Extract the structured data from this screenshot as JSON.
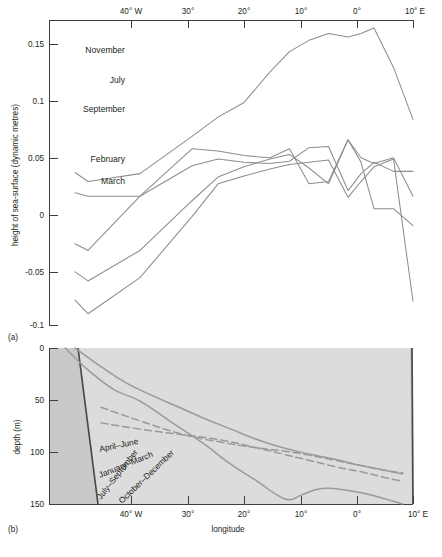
{
  "figure": {
    "panel_a_label": "(a)",
    "panel_b_label": "(b)"
  },
  "panel_a": {
    "y_axis_title": "height of sea-surface  (dynamic metres)",
    "y_ticks": [
      "0.15",
      "0.1",
      "0.05",
      "0",
      "-0.05",
      "-0.1"
    ],
    "x_ticks": [
      "40° W",
      "30°",
      "20°",
      "10°",
      "0°",
      "10° E"
    ],
    "series_labels": [
      "November",
      "July",
      "September",
      "February",
      "March"
    ]
  },
  "panel_b": {
    "y_axis_title": "depth (m)",
    "x_axis_title": "longitude",
    "y_ticks": [
      "0",
      "50",
      "100",
      "150"
    ],
    "x_ticks": [
      "40° W",
      "30°",
      "20°",
      "10°",
      "0°",
      "10° E"
    ],
    "curve_labels": [
      "April–June",
      "January–March",
      "July–September",
      "October–December"
    ]
  },
  "colors": {
    "curve": "#8d8d8d",
    "axis": "#3f3f3f",
    "panel_b_background": "#dcdcdc",
    "panel_b_land": "#c9c9c9",
    "shelf": "#4a4a4a"
  },
  "chart_data": [
    {
      "type": "line",
      "panel": "(a)",
      "title": "",
      "xlabel": "longitude",
      "ylabel": "height of sea-surface  (dynamic metres)",
      "xlim": [
        -46,
        10
      ],
      "ylim": [
        -0.1,
        0.17
      ],
      "x_tick_values": [
        -40,
        -30,
        -20,
        -10,
        0,
        10
      ],
      "x_tick_labels": [
        "40° W",
        "30°",
        "20°",
        "10°",
        "0°",
        "10° E"
      ],
      "y_tick_values": [
        0.15,
        0.1,
        0.05,
        0,
        -0.05,
        -0.1
      ],
      "y_tick_labels": [
        "0.15",
        "0.1",
        "0.05",
        "0",
        "-0.05",
        "-0.1"
      ],
      "grid": false,
      "legend_position": "inline-left-labels",
      "series": [
        {
          "name": "November",
          "x": [
            -42,
            -40,
            -32,
            -24,
            -20,
            -16,
            -12,
            -9,
            -6,
            -3,
            0,
            2,
            4,
            7,
            10
          ],
          "values": [
            0.148,
            0.16,
            0.128,
            0.074,
            0.045,
            0.038,
            0.032,
            0.028,
            0.026,
            0.024,
            0.057,
            0.043,
            0.03,
            0.023,
            0.149
          ]
        },
        {
          "name": "July",
          "x": [
            -42,
            -40,
            -32,
            -24,
            -20,
            -16,
            -12,
            -9,
            -6,
            -3,
            0,
            2,
            4,
            7,
            10
          ],
          "values": [
            0.123,
            0.131,
            0.104,
            0.06,
            0.039,
            0.03,
            0.023,
            0.019,
            0.031,
            0.045,
            0.006,
            0.026,
            0.067,
            0.067,
            0.082
          ]
        },
        {
          "name": "September",
          "x": [
            -42,
            -40,
            -32,
            -24,
            -20,
            -16,
            -12,
            -9,
            -6,
            -3,
            0,
            2,
            4,
            7,
            10
          ],
          "values": [
            0.098,
            0.104,
            0.056,
            0.014,
            0.016,
            0.02,
            0.022,
            0.014,
            0.045,
            0.043,
            0.006,
            0.022,
            0.027,
            0.022,
            0.056
          ]
        },
        {
          "name": "February",
          "x": [
            -42,
            -40,
            -32,
            -24,
            -20,
            -16,
            -12,
            -9,
            -6,
            -3,
            0,
            2,
            4,
            7,
            10
          ],
          "values": [
            0.053,
            0.056,
            0.056,
            0.029,
            0.023,
            0.026,
            0.027,
            0.025,
            0.013,
            0.012,
            0.051,
            0.036,
            0.026,
            0.034,
            0.034
          ]
        },
        {
          "name": "March",
          "x": [
            -42,
            -40,
            -32,
            -24,
            -20,
            -16,
            -12,
            -9,
            -6,
            -3,
            0,
            2,
            4,
            7,
            10
          ],
          "values": [
            0.035,
            0.043,
            0.036,
            0.003,
            -0.014,
            -0.027,
            -0.054,
            -0.072,
            -0.082,
            -0.088,
            -0.085,
            -0.088,
            -0.093,
            -0.058,
            -0.012
          ]
        }
      ]
    },
    {
      "type": "line",
      "panel": "(b)",
      "title": "",
      "xlabel": "longitude",
      "ylabel": "depth (m)",
      "xlim": [
        -46,
        10
      ],
      "ylim": [
        150,
        0
      ],
      "y_inverted": true,
      "x_tick_values": [
        -40,
        -30,
        -20,
        -10,
        0,
        10
      ],
      "x_tick_labels": [
        "40° W",
        "30°",
        "20°",
        "10°",
        "0°",
        "10° E"
      ],
      "y_tick_values": [
        0,
        50,
        100,
        150
      ],
      "y_tick_labels": [
        "0",
        "50",
        "100",
        "150"
      ],
      "grid": false,
      "legend_position": "inline-curve-labels",
      "series": [
        {
          "name": "April–June",
          "style": "dashed",
          "x": [
            -38,
            -32,
            -26,
            -20,
            -14,
            -10,
            -6,
            -2,
            2,
            6,
            8.4
          ],
          "values": [
            78,
            72,
            67,
            62,
            54,
            48,
            42,
            36,
            31,
            25,
            22
          ]
        },
        {
          "name": "January–March",
          "style": "dashed",
          "x": [
            -38,
            -32,
            -26,
            -20,
            -14,
            -10,
            -6,
            -2,
            2,
            6,
            8.4
          ],
          "values": [
            93,
            80,
            68,
            60,
            54,
            51,
            47,
            42,
            37,
            32,
            30
          ]
        },
        {
          "name": "July–September",
          "style": "solid",
          "x": [
            -43.5,
            -40,
            -36,
            -32,
            -27,
            -22,
            -18,
            -14,
            -11,
            -9,
            -7,
            -4,
            0,
            4,
            8.4
          ],
          "values": [
            150,
            129,
            110,
            99,
            78,
            57,
            38,
            22,
            9,
            4,
            9,
            15,
            13,
            8,
            0
          ]
        },
        {
          "name": "October–December",
          "style": "solid",
          "x": [
            -42,
            -38,
            -34,
            -30,
            -26,
            -22,
            -18,
            -14,
            -10,
            -6,
            -2,
            2,
            6,
            8.4
          ],
          "values": [
            150,
            132,
            116,
            104,
            93,
            82,
            72,
            62,
            54,
            48,
            43,
            37,
            32,
            29
          ]
        }
      ],
      "annotations": [
        {
          "text": "April–June",
          "rotation": -12
        },
        {
          "text": "January–March",
          "rotation": -22
        },
        {
          "text": "July–September",
          "rotation": -52
        },
        {
          "text": "October–December",
          "rotation": -44
        }
      ]
    }
  ]
}
